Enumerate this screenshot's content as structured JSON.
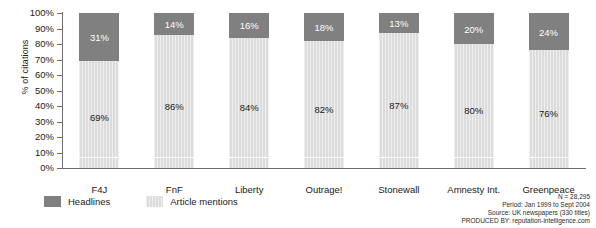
{
  "chart_data": {
    "type": "bar",
    "subtype": "stacked-100-percent",
    "title": "",
    "xlabel": "",
    "ylabel": "% of citations",
    "ylim": [
      0,
      100
    ],
    "ytick_labels": [
      "100%",
      "90%",
      "80%",
      "70%",
      "60%",
      "50%",
      "40%",
      "30%",
      "20%",
      "10%",
      "0%"
    ],
    "ytick_values": [
      100,
      90,
      80,
      70,
      60,
      50,
      40,
      30,
      20,
      10,
      0
    ],
    "grid": false,
    "legend_position": "bottom-left",
    "categories": [
      "F4J",
      "FnF",
      "Liberty",
      "Outrage!",
      "Stonewall",
      "Amnesty Int.",
      "Greenpeace"
    ],
    "series": [
      {
        "name": "Headlines",
        "color": "#808080",
        "values": [
          31,
          14,
          16,
          18,
          13,
          20,
          24
        ],
        "labels": [
          "31%",
          "14%",
          "16%",
          "18%",
          "13%",
          "20%",
          "24%"
        ]
      },
      {
        "name": "Article mentions",
        "color": "#dcdcdc",
        "values": [
          69,
          86,
          84,
          82,
          87,
          80,
          76
        ],
        "labels": [
          "69%",
          "86%",
          "84%",
          "82%",
          "87%",
          "80%",
          "76%"
        ]
      }
    ]
  },
  "axis": {
    "y_title": "% of citations"
  },
  "legend": {
    "items": [
      {
        "label": "Headlines",
        "swatch": "headlines-swatch"
      },
      {
        "label": "Article mentions",
        "swatch": "article-mentions-swatch"
      }
    ]
  },
  "footnote": {
    "lines": [
      "N = 28,295",
      "Period: Jan 1999 to Sept 2004",
      "Source: UK newspapers (330 titles)",
      "PRODUCED BY: reputation-intelligence.com"
    ]
  }
}
